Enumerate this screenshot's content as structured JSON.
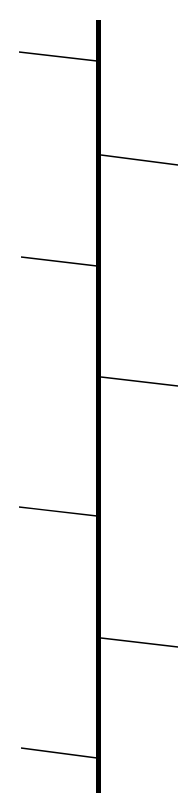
{
  "diagram": {
    "background": "#ffffff",
    "stroke_color": "#000000",
    "stem": {
      "x": 98.5,
      "y1": 20,
      "y2": 793,
      "width": 5
    },
    "branches": [
      {
        "side": "left",
        "x1": 19,
        "y1": 52,
        "x2": 97,
        "y2": 61,
        "width": 1.3
      },
      {
        "side": "right",
        "x1": 101,
        "y1": 155,
        "x2": 178,
        "y2": 165,
        "width": 1.3
      },
      {
        "side": "left",
        "x1": 21,
        "y1": 257,
        "x2": 97,
        "y2": 266,
        "width": 1.3
      },
      {
        "side": "right",
        "x1": 101,
        "y1": 377,
        "x2": 178,
        "y2": 386,
        "width": 1.3
      },
      {
        "side": "left",
        "x1": 19,
        "y1": 507,
        "x2": 97,
        "y2": 516,
        "width": 1.3
      },
      {
        "side": "right",
        "x1": 101,
        "y1": 638,
        "x2": 178,
        "y2": 647,
        "width": 1.3
      },
      {
        "side": "left",
        "x1": 21,
        "y1": 748,
        "x2": 97,
        "y2": 758,
        "width": 1.3
      }
    ]
  }
}
